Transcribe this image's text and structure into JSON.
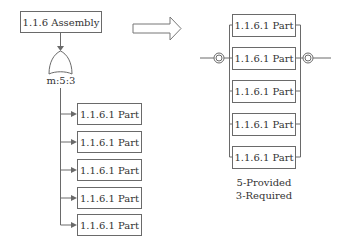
{
  "left": {
    "assembly": {
      "label": "1.1.6 Assembly"
    },
    "gate": {
      "type": "voting-gate",
      "label": "m:5:3"
    },
    "parts": [
      {
        "label": "1.1.6.1 Part"
      },
      {
        "label": "1.1.6.1 Part"
      },
      {
        "label": "1.1.6.1 Part"
      },
      {
        "label": "1.1.6.1 Part"
      },
      {
        "label": "1.1.6.1 Part"
      }
    ]
  },
  "arrow": {
    "icon": "hollow-right-arrow-icon"
  },
  "right": {
    "parts": [
      {
        "label": "1.1.6.1 Part"
      },
      {
        "label": "1.1.6.1 Part"
      },
      {
        "label": "1.1.6.1 Part"
      },
      {
        "label": "1.1.6.1 Part"
      },
      {
        "label": "1.1.6.1 Part"
      }
    ],
    "caption": {
      "provided": "5-Provided",
      "required": "3-Required"
    }
  },
  "colors": {
    "line": "#6a6a6a",
    "text": "#333333",
    "background": "#ffffff"
  }
}
